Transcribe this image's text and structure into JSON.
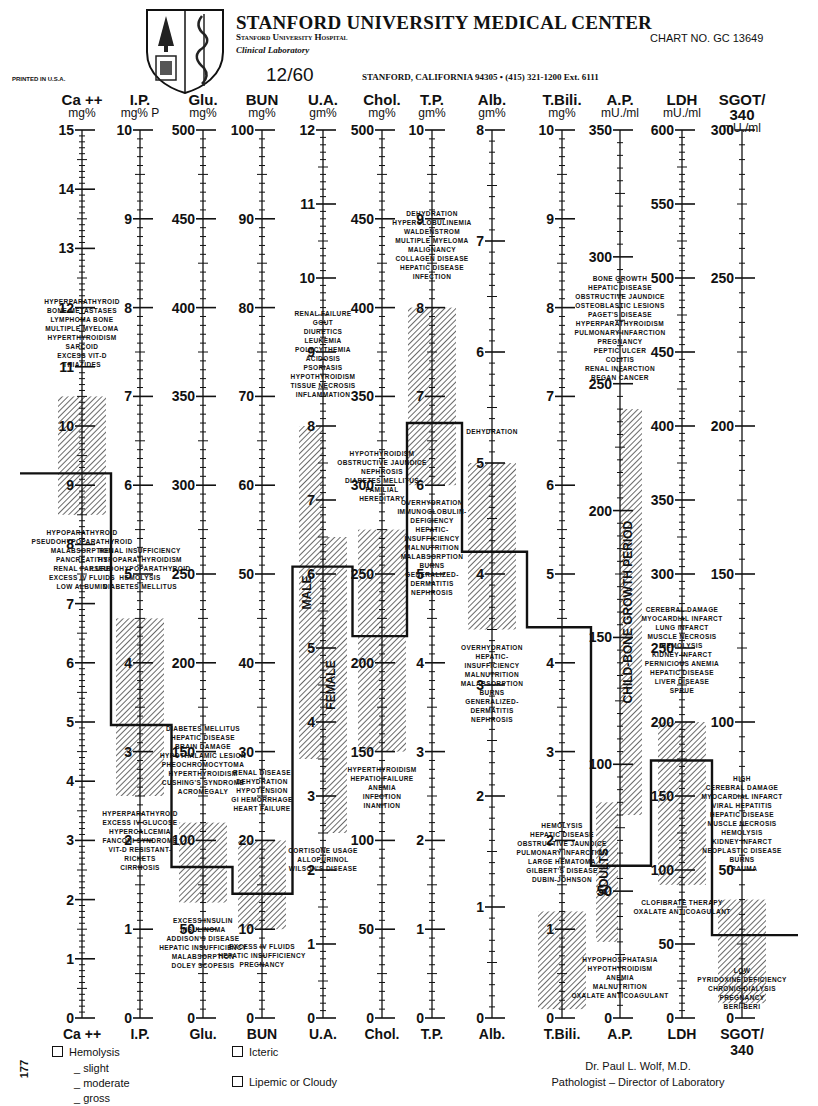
{
  "header": {
    "title": "STANFORD UNIVERSITY MEDICAL CENTER",
    "hospital": "Stanford University Hospital",
    "department": "Clinical Laboratory",
    "chart_no": "CHART NO. GC 13649",
    "date": "12/60",
    "address": "STANFORD, CALIFORNIA 94305 • (415) 321-1200 Ext. 6111",
    "printed": "PRINTED IN U.S.A."
  },
  "footer": {
    "hemolysis": "Hemolysis",
    "slight": "_ slight",
    "moderate": "_ moderate",
    "gross": "_ gross",
    "icteric": "Icteric",
    "lipemic": "Lipemic or Cloudy",
    "doctor": "Dr. Paul L. Wolf, M.D.",
    "role": "Pathologist – Director of Laboratory",
    "side_number": "177"
  },
  "colors": {
    "ink": "#111111",
    "paper": "#ffffff",
    "hatch": "#555555"
  },
  "chart_data": {
    "type": "table",
    "layout": {
      "y_top_px": 130,
      "y_bottom_px": 1018,
      "grid": false,
      "legend_position": "bottom"
    },
    "columns": [
      {
        "key": "ca",
        "name": "Ca ++",
        "foot": "Ca ++",
        "unit": "mg%",
        "x": 82,
        "max": 15,
        "labels": [
          0,
          1,
          2,
          3,
          4,
          5,
          6,
          7,
          8,
          9,
          10,
          11,
          12,
          13,
          14,
          15
        ],
        "normal": [
          8.5,
          10.5
        ],
        "patient": 9.2,
        "notes_high": [
          "HYPERPARATHYROID",
          "BONE METASTASES",
          "LYMPHOMA BONE",
          "MULTIPLE MYELOMA",
          "HYPERTHYROIDISM",
          "SARCOID",
          "EXCESS VIT-D",
          "THIAZIDES"
        ],
        "notes_low": [
          "HYPOPARATHYROID",
          "PSEUDOHYPOPARATHYROID",
          "MALABSORPTION",
          "PANCREATITIS",
          "RENAL FAILURE",
          "EXCESS IV FLUIDS",
          "LOW ALBUMIN"
        ]
      },
      {
        "key": "ip",
        "name": "I.P.",
        "foot": "I.P.",
        "unit": "mg% P",
        "x": 140,
        "max": 10,
        "labels": [
          0,
          1,
          2,
          3,
          4,
          5,
          6,
          7,
          8,
          9,
          10
        ],
        "normal": [
          2.5,
          4.5
        ],
        "patient": 3.3,
        "notes_high": [
          "RENAL INSUFFICIENCY",
          "HYPOPARATHYROIDISM",
          "PSEUDOHYPOPARATHYROID",
          "HEMOLYSIS",
          "DIABETES MELLITUS"
        ],
        "notes_low": [
          "HYPERPARATHYROID",
          "EXCESS IV GLUCOSE",
          "HYPERCALCEMIA",
          "FANCONI SYNDROME",
          "VIT-D RESISTANT-",
          "RICKETS",
          "CIRRHOSIS"
        ]
      },
      {
        "key": "glu",
        "name": "Glu.",
        "foot": "Glu.",
        "unit": "mg%",
        "x": 203,
        "max": 500,
        "labels": [
          0,
          50,
          100,
          150,
          200,
          250,
          300,
          350,
          400,
          450,
          500
        ],
        "normal": [
          65,
          110
        ],
        "patient": 85,
        "notes_high": [
          "DIABETES MELLITUS",
          "HEPATIC DISEASE",
          "BRAIN DAMAGE",
          "HYPOTHALAMIC LESION",
          "PHEOCHROMOCYTOMA",
          "HYPERTHYROIDISM",
          "CUSHING'S SYNDROME",
          "ACROMEGALY"
        ],
        "notes_low": [
          "EXCESS INSULIN",
          "INSULINOMA",
          "ADDISON'S DISEASE",
          "HEPATIC INSUFFICIENCY",
          "MALABSORPTION",
          "DOLEY SCOPESIS"
        ]
      },
      {
        "key": "bun",
        "name": "BUN",
        "foot": "BUN",
        "unit": "mg%",
        "x": 262,
        "max": 100,
        "labels": [
          0,
          10,
          20,
          30,
          40,
          50,
          60,
          70,
          80,
          90,
          100
        ],
        "normal": [
          10,
          20
        ],
        "patient": 14,
        "notes_high": [
          "RENAL DISEASE",
          "DEHYDRATION",
          "HYPOTENSION",
          "GI HEMORRHAGE",
          "HEART FAILURE"
        ],
        "notes_low": [
          "EXCESS IV FLUIDS",
          "HEPATIC INSUFFICIENCY",
          "PREGNANCY"
        ]
      },
      {
        "key": "ua",
        "name": "U.A.",
        "foot": "U.A.",
        "unit": "gm%",
        "x": 323,
        "max": 12,
        "labels": [
          0,
          1,
          2,
          3,
          4,
          5,
          6,
          7,
          8,
          9,
          10,
          11,
          12
        ],
        "normal_male": [
          3.5,
          8.0
        ],
        "normal_female": [
          2.5,
          6.5
        ],
        "patient": 6.1,
        "band_labels": [
          "MALE",
          "FEMALE"
        ],
        "notes_high": [
          "RENAL FAILURE",
          "GOUT",
          "DIURETICS",
          "LEUKEMIA",
          "POLYCYTHEMIA",
          "ACIDOSIS",
          "PSORIASIS",
          "HYPOTHYROIDISM",
          "TISSUE NECROSIS",
          "INFLAMMATION"
        ],
        "notes_low": [
          "CORTISONE USAGE",
          "ALLOPURINOL",
          "WILSON'S DISEASE"
        ]
      },
      {
        "key": "chol",
        "name": "Chol.",
        "foot": "Chol.",
        "unit": "mg%",
        "x": 382,
        "max": 500,
        "labels": [
          0,
          50,
          100,
          150,
          200,
          250,
          300,
          350,
          400,
          450,
          500
        ],
        "normal": [
          150,
          275
        ],
        "patient": 215,
        "notes_high": [
          "HYPOTHYROIDISM",
          "OBSTRUCTIVE JAUNDICE",
          "NEPHROSIS",
          "DIABETES MELLITUS",
          "FAMILIAL",
          "HEREDITARY"
        ],
        "notes_low": [
          "HYPERTHYROIDISM",
          "HEPATIC FAILURE",
          "ANEMIA",
          "INFECTION",
          "INANITION"
        ]
      },
      {
        "key": "tp",
        "name": "T.P.",
        "foot": "T.P.",
        "unit": "gm%",
        "x": 432,
        "max": 10,
        "labels": [
          0,
          1,
          2,
          3,
          4,
          5,
          6,
          7,
          8,
          9,
          10
        ],
        "normal": [
          6.0,
          8.0
        ],
        "patient": 6.7,
        "notes_high": [
          "DEHYDRATION",
          "HYPERGLOBULINEMIA",
          "WALDENSTROM",
          "MULTIPLE MYELOMA",
          "MALIGNANCY",
          "COLLAGEN DISEASE",
          "HEPATIC DISEASE",
          "INFECTION"
        ],
        "notes_low": [
          "OVERHYDRATION",
          "IMMUNOGLOBULIN-",
          "DEFICIENCY",
          "HEPATIC-",
          "INSUFFICIENCY",
          "MALNUTRITION",
          "MALABSORPTION",
          "BURNS",
          "GENERALIZED-",
          "DERMATITIS",
          "NEPHROSIS"
        ]
      },
      {
        "key": "alb",
        "name": "Alb.",
        "foot": "Alb.",
        "unit": "gm%",
        "x": 492,
        "max": 8,
        "labels": [
          0,
          1,
          2,
          3,
          4,
          5,
          6,
          7,
          8
        ],
        "normal": [
          3.5,
          5.0
        ],
        "patient": 4.2,
        "notes_high": [
          "DEHYDRATION"
        ],
        "notes_low": [
          "OVERHYDRATION",
          "HEPATIC-",
          "INSUFFICIENCY",
          "MALNUTRITION",
          "MALABSORPTION",
          "BURNS",
          "GENERALIZED-",
          "DERMATITIS",
          "NEPHROSIS"
        ]
      },
      {
        "key": "tbili",
        "name": "T.Bili.",
        "foot": "T.Bili.",
        "unit": "mg%",
        "x": 562,
        "max": 10,
        "labels": [
          0,
          1,
          2,
          3,
          4,
          5,
          6,
          7,
          8,
          9,
          10
        ],
        "normal": [
          0.1,
          1.2
        ],
        "patient": 4.4,
        "notes_high": [
          "HEMOLYSIS",
          "HEPATIC DISEASE",
          "OBSTRUCTIVE JAUNDICE",
          "PULMONARY INFARCTION",
          "LARGE HEMATOMA",
          "GILBERT'S DISEASE",
          "DUBIN-JOHNSON"
        ],
        "notes_low": []
      },
      {
        "key": "ap",
        "name": "A.P.",
        "foot": "A.P.",
        "unit": "mU./ml",
        "x": 620,
        "max": 350,
        "labels": [
          0,
          50,
          100,
          150,
          200,
          250,
          300,
          350
        ],
        "normal_adults": [
          30,
          85
        ],
        "normal_child": [
          80,
          240
        ],
        "patient": 60,
        "band_labels": [
          "ADULTS",
          "CHILD-BONE GROWTH PERIOD"
        ],
        "notes_high": [
          "BONE GROWTH",
          "HEPATIC DISEASE",
          "OBSTRUCTIVE JAUNDICE",
          "OSTEOBLASTIC LESIONS",
          "PAGET'S DISEASE",
          "HYPERPARATHYROIDISM",
          "PULMONARY INFARCTION",
          "PREGNANCY",
          "PEPTIC ULCER",
          "COLITIS",
          "RENAL INFARCTION",
          "REGAN CANCER"
        ],
        "notes_low": [
          "HYPOPHOSPHATASIA",
          "HYPOTHYROIDISM",
          "ANEMIA",
          "MALNUTRITION",
          "OXALATE ANTICOAGULANT"
        ]
      },
      {
        "key": "ldh",
        "name": "LDH",
        "foot": "LDH",
        "unit": "mU./ml",
        "x": 682,
        "max": 600,
        "labels": [
          0,
          50,
          100,
          150,
          200,
          250,
          300,
          350,
          400,
          450,
          500,
          550,
          600
        ],
        "normal": [
          90,
          200
        ],
        "patient": 174,
        "notes_high": [
          "CEREBRAL DAMAGE",
          "MYOCARDIAL INFARCT",
          "LUNG INFARCT",
          "MUSCLE NECROSIS",
          "HEMOLYSIS",
          "KIDNEY INFARCT",
          "PERNICIOUS ANEMIA",
          "HEPATIC DISEASE",
          "LIVER DISEASE",
          "SPRUE"
        ],
        "notes_low": [
          "CLOFIBRATE THERAPY",
          "OXALATE ANTICOAGULANT"
        ]
      },
      {
        "key": "sgot",
        "name": "SGOT/ 340",
        "foot": "SGOT/ 340",
        "unit": "mU./ml",
        "x": 742,
        "max": 300,
        "labels": [
          0,
          50,
          100,
          150,
          200,
          250,
          300
        ],
        "normal": [
          5,
          40
        ],
        "patient": 28,
        "notes_high": [
          "HIGH",
          "CEREBRAL DAMAGE",
          "MYOCARDIAL INFARCT",
          "VIRAL HEPATITIS",
          "HEPATIC DISEASE",
          "MUSCLE NECROSIS",
          "HEMOLYSIS",
          "KIDNEY INFARCT",
          "NEOPLASTIC DISEASE",
          "BURNS",
          "TRAUMA"
        ],
        "notes_low": [
          "LOW",
          "PYRIDOXINE DEFICIENCY",
          "CHRONIC DIALYSIS",
          "PREGNANCY",
          "BERI-BERI"
        ]
      }
    ]
  }
}
